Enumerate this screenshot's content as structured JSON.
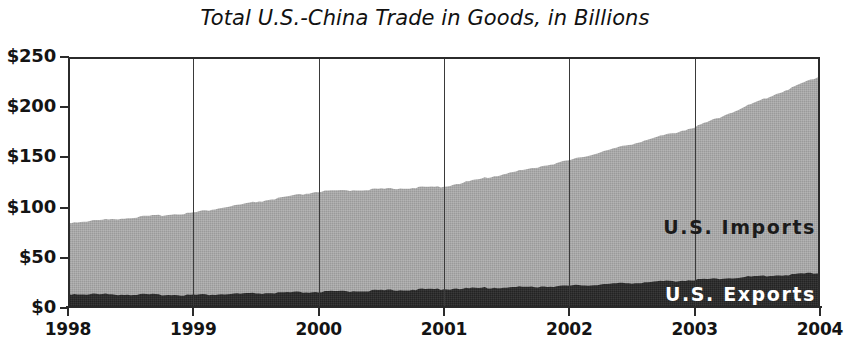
{
  "chart_data": {
    "type": "area",
    "subtype": "stacked-area",
    "title": "Total U.S.-China Trade in Goods, in Billions",
    "xlabel": "",
    "ylabel": "",
    "x": [
      1998,
      1999,
      2000,
      2001,
      2002,
      2003,
      2004
    ],
    "categories": [
      "1998",
      "1999",
      "2000",
      "2001",
      "2002",
      "2003",
      "2004"
    ],
    "xtick_labels": [
      "1998",
      "1999",
      "2000",
      "2001",
      "2002",
      "2003",
      "2004"
    ],
    "ytick_labels": [
      "$250",
      "$200",
      "$150",
      "$100",
      "$50",
      "$0"
    ],
    "ytick_values": [
      250,
      200,
      150,
      100,
      50,
      0
    ],
    "ylim": [
      0,
      250
    ],
    "xlim": [
      1998,
      2004
    ],
    "grid": "vertical-only",
    "legend_position": "in-plot-right",
    "series": [
      {
        "name": "U.S. Exports",
        "label": "U.S. Exports",
        "color": "#2a2a2a",
        "label_color": "#ffffff",
        "values": [
          14,
          13,
          16,
          19,
          22,
          28,
          35
        ]
      },
      {
        "name": "U.S. Imports",
        "label": "U.S. Imports",
        "color": "#a6a6a6",
        "label_color": "#1b1b1b",
        "values": [
          71,
          82,
          100,
          102,
          125,
          152,
          196
        ]
      }
    ],
    "totals": [
      85,
      95,
      116,
      121,
      147,
      180,
      231
    ]
  },
  "axes": {
    "y_labels": [
      "$250",
      "$200",
      "$150",
      "$100",
      "$50",
      "$0"
    ],
    "x_labels": [
      "1998",
      "1999",
      "2000",
      "2001",
      "2002",
      "2003",
      "2004"
    ]
  },
  "labels": {
    "imports": "U.S. Imports",
    "exports": "U.S. Exports"
  }
}
